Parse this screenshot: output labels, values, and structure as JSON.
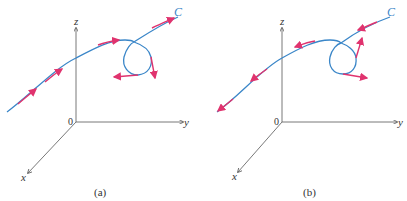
{
  "colors": {
    "axis": "#555555",
    "curve": "#3a86c8",
    "tangent_arrow": "#e0336e",
    "text": "#333333"
  },
  "panels": [
    {
      "id": "a",
      "caption": "(a)",
      "curve_label": "C",
      "origin_label": "0",
      "axis_labels": {
        "x": "x",
        "y": "y",
        "z": "z"
      },
      "orientation": "forward (toward C end, upper right)"
    },
    {
      "id": "b",
      "caption": "(b)",
      "curve_label": "C",
      "origin_label": "0",
      "axis_labels": {
        "x": "x",
        "y": "y",
        "z": "z"
      },
      "orientation": "reverse (toward lower left)"
    }
  ]
}
